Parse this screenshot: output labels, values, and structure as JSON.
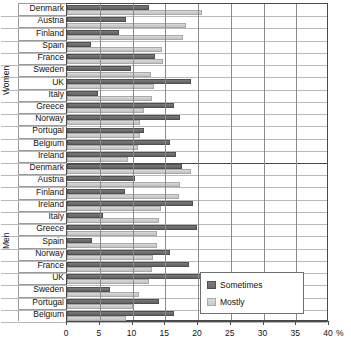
{
  "chart_data": {
    "type": "bar",
    "orientation": "horizontal",
    "title": "",
    "xlabel": "%",
    "ylabel": "",
    "xlim": [
      0,
      40
    ],
    "xticks": [
      0,
      5,
      10,
      15,
      20,
      25,
      30,
      35,
      40
    ],
    "xtick_labels": [
      "0",
      "5",
      "10",
      "15",
      "20",
      "25",
      "30",
      "35",
      "40"
    ],
    "axis_unit_label": "%",
    "grid": true,
    "legend_position": "bottom-right",
    "legend": [
      "Sometimes",
      "Mostly"
    ],
    "series": [
      {
        "name": "Sometimes",
        "color": "#6e6e6e"
      },
      {
        "name": "Mostly",
        "color": "#cfcfcf"
      }
    ],
    "groups": [
      {
        "name": "Women",
        "categories": [
          "Denmark",
          "Austria",
          "Finland",
          "Spain",
          "France",
          "Sweden",
          "UK",
          "Italy",
          "Greece",
          "Norway",
          "Portugal",
          "Belgium",
          "Ireland"
        ],
        "values": {
          "Sometimes": [
            12.5,
            9.0,
            8.0,
            3.7,
            13.4,
            9.8,
            18.9,
            4.8,
            16.3,
            17.3,
            11.8,
            15.7,
            16.6
          ],
          "Mostly": [
            20.6,
            18.2,
            17.7,
            14.5,
            14.6,
            12.8,
            13.3,
            13.0,
            11.7,
            11.2,
            11.1,
            10.8,
            9.3
          ]
        }
      },
      {
        "name": "Men",
        "categories": [
          "Denmark",
          "Austria",
          "Finland",
          "Ireland",
          "Italy",
          "Greece",
          "Spain",
          "Norway",
          "France",
          "UK",
          "Sweden",
          "Portugal",
          "Belgium"
        ],
        "values": {
          "Sometimes": [
            17.5,
            10.4,
            8.9,
            19.2,
            5.5,
            19.8,
            3.8,
            15.7,
            18.7,
            30.2,
            6.5,
            14.1,
            16.4
          ],
          "Mostly": [
            19.0,
            17.3,
            17.1,
            14.4,
            14.0,
            13.8,
            13.8,
            13.2,
            13.0,
            12.5,
            11.0,
            10.0,
            9.0
          ]
        }
      }
    ]
  }
}
